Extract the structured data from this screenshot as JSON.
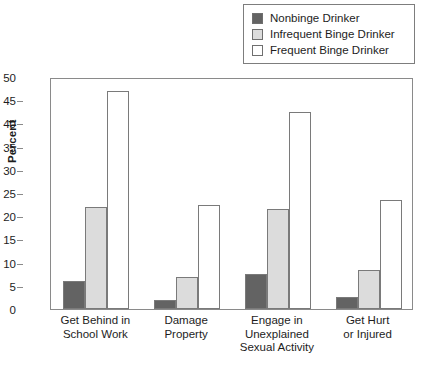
{
  "chart_data": {
    "type": "bar",
    "title": "",
    "xlabel": "",
    "ylabel": "Percent",
    "ylim": [
      0,
      50
    ],
    "yticks": [
      0,
      5,
      10,
      15,
      20,
      25,
      30,
      35,
      40,
      45,
      50
    ],
    "grid": false,
    "legend_position": "top-right",
    "categories": [
      "Get Behind in\nSchool Work",
      "Damage\nProperty",
      "Engage in\nUnexplained\nSexual Activity",
      "Get Hurt\nor Injured"
    ],
    "category_lines": [
      [
        "Get Behind in",
        "School Work"
      ],
      [
        "Damage",
        "Property"
      ],
      [
        "Engage in",
        "Unexplained",
        "Sexual Activity"
      ],
      [
        "Get Hurt",
        "or Injured"
      ]
    ],
    "series": [
      {
        "name": "Nonbinge Drinker",
        "color": "#636363",
        "values": [
          6,
          2,
          7.5,
          2.5
        ]
      },
      {
        "name": "Infrequent Binge Drinker",
        "color": "#dcdcdc",
        "values": [
          22,
          7,
          21.5,
          8.5
        ]
      },
      {
        "name": "Frequent Binge Drinker",
        "color": "#ffffff",
        "values": [
          47,
          22.5,
          42.5,
          23.5
        ]
      }
    ]
  },
  "legend": {
    "items": [
      {
        "label": "Nonbinge Drinker",
        "color": "#636363"
      },
      {
        "label": "Infrequent Binge Drinker",
        "color": "#dcdcdc"
      },
      {
        "label": "Frequent Binge Drinker",
        "color": "#ffffff"
      }
    ]
  },
  "axis": {
    "y_title": "Percent"
  }
}
